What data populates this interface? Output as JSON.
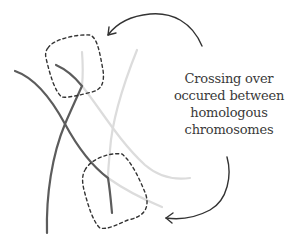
{
  "diagram": {
    "caption_lines": [
      "Crossing over",
      "occured between",
      "homologous",
      "chromosomes"
    ],
    "colors": {
      "dark_strand": "#5a5a5a",
      "light_strand": "#d9d9d9",
      "dashed_outline": "#333333",
      "arrow": "#333333",
      "text": "#3a3a3a"
    },
    "highlights": [
      {
        "name": "upper-crossover-region"
      },
      {
        "name": "lower-crossover-region"
      }
    ],
    "arrows": [
      {
        "name": "arrow-to-upper-region"
      },
      {
        "name": "arrow-to-lower-region"
      }
    ]
  }
}
